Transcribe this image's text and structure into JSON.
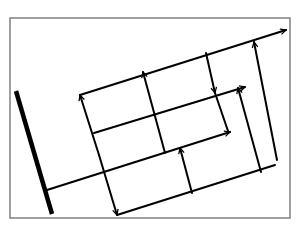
{
  "diagram": {
    "title": "",
    "colors": {
      "stroke": "#000000",
      "frame": "#808080",
      "background": "#ffffff"
    },
    "frame": {
      "x": 10,
      "y": 18,
      "width": 280,
      "height": 200
    },
    "thick_bar": {
      "x1": 16,
      "y1": 91,
      "x2": 52,
      "y2": 214
    },
    "lines": [
      {
        "id": "top-axis",
        "x1": 80,
        "y1": 95,
        "x2": 286,
        "y2": 30,
        "arrow_end": true,
        "arrow_start": false
      },
      {
        "id": "mid-axis",
        "x1": 94,
        "y1": 133,
        "x2": 245,
        "y2": 87,
        "arrow_end": true,
        "arrow_start": false
      },
      {
        "id": "lower-mid-axis",
        "x1": 47,
        "y1": 190,
        "x2": 230,
        "y2": 132,
        "arrow_end": true,
        "arrow_start": false
      },
      {
        "id": "bottom-axis",
        "x1": 117,
        "y1": 215,
        "x2": 275,
        "y2": 165,
        "arrow_end": false,
        "arrow_start": false
      },
      {
        "id": "bottom-axis-arrow",
        "x1": 255,
        "y1": 170,
        "x2": 275,
        "y2": 146,
        "arrow_end": false,
        "arrow_start": false,
        "hidden": true
      },
      {
        "id": "left-perp-up",
        "x1": 99,
        "y1": 155,
        "x2": 80,
        "y2": 95,
        "arrow_end": true
      },
      {
        "id": "left-perp-down",
        "x1": 99,
        "y1": 155,
        "x2": 117,
        "y2": 215,
        "arrow_end": true
      },
      {
        "id": "perp-2",
        "x1": 165,
        "y1": 153,
        "x2": 143,
        "y2": 72,
        "arrow_end": true
      },
      {
        "id": "perp-3",
        "x1": 192,
        "y1": 193,
        "x2": 180,
        "y2": 148,
        "arrow_end": true
      },
      {
        "id": "perp-4-down",
        "x1": 206,
        "y1": 53,
        "x2": 215,
        "y2": 93,
        "arrow_end": true
      },
      {
        "id": "perp-4-rest",
        "x1": 215,
        "y1": 93,
        "x2": 228,
        "y2": 131,
        "arrow_end": false
      },
      {
        "id": "perp-5",
        "x1": 261,
        "y1": 172,
        "x2": 238,
        "y2": 88,
        "arrow_end": true
      },
      {
        "id": "perp-6",
        "x1": 277,
        "y1": 160,
        "x2": 254,
        "y2": 42,
        "arrow_end": true
      }
    ]
  }
}
